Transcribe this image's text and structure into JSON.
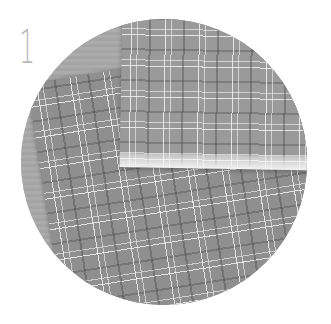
{
  "step": {
    "number": "1"
  },
  "image": {
    "description": "Circular cropped photo of two overlapping plaid fabric sheets (grayscale) on a wooden table",
    "colors": {
      "fabric": "#8f8f8f",
      "plaid_lines": "#ffffff",
      "table": "#a9a9a9",
      "step_number": "#b9b9b9"
    }
  }
}
